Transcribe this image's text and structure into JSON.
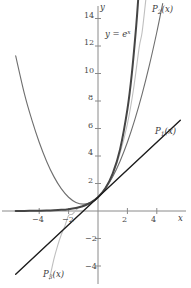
{
  "figure": {
    "background": "#ffffff"
  },
  "axes": {
    "x_label": "x",
    "y_label": "y",
    "x_ticks": [
      {
        "value": -4,
        "label": "−4"
      },
      {
        "value": -2,
        "label": "−2"
      },
      {
        "value": 2,
        "label": "2"
      },
      {
        "value": 4,
        "label": "4"
      }
    ],
    "y_ticks": [
      {
        "value": 14,
        "label": "14"
      },
      {
        "value": 12,
        "label": "12"
      },
      {
        "value": 10,
        "label": "10"
      },
      {
        "value": 8,
        "label": "8"
      },
      {
        "value": 6,
        "label": "6"
      },
      {
        "value": 4,
        "label": "4"
      },
      {
        "value": 2,
        "label": "2"
      },
      {
        "value": -2,
        "label": "−2"
      },
      {
        "value": -4,
        "label": "−4"
      }
    ],
    "axis_color": "#8a8a8a"
  },
  "curve_labels": {
    "exp": {
      "text_prefix": "y = e",
      "text_exponent": "x",
      "full": "y = eˣ"
    },
    "p1": {
      "base": "P",
      "sub": "1",
      "arg": "(x)",
      "full": "P₁(x)"
    },
    "p2": {
      "base": "P",
      "sub": "2",
      "arg": "(x)",
      "full": "P₂(x)"
    },
    "p3": {
      "base": "P",
      "sub": "3",
      "arg": "(x)",
      "full": "P₃(x)"
    }
  },
  "chart_data": {
    "type": "line",
    "title": "",
    "xlabel": "x",
    "ylabel": "y",
    "xlim": [
      -5.6,
      5.6
    ],
    "ylim": [
      -5.2,
      15.4
    ],
    "grid": false,
    "legend": "inline-annotations",
    "series": [
      {
        "name": "y = e^x",
        "label": "y = eˣ",
        "color": "#454545",
        "width": 2.0,
        "formula": "exp(x)",
        "points": [
          [
            -5.6,
            0.0037
          ],
          [
            -5.0,
            0.0067
          ],
          [
            -4.5,
            0.0111
          ],
          [
            -4.0,
            0.0183
          ],
          [
            -3.5,
            0.0302
          ],
          [
            -3.0,
            0.0498
          ],
          [
            -2.5,
            0.0821
          ],
          [
            -2.0,
            0.1353
          ],
          [
            -1.5,
            0.2231
          ],
          [
            -1.0,
            0.3679
          ],
          [
            -0.5,
            0.6065
          ],
          [
            0.0,
            1.0
          ],
          [
            0.5,
            1.6487
          ],
          [
            1.0,
            2.7183
          ],
          [
            1.5,
            4.4817
          ],
          [
            2.0,
            7.3891
          ],
          [
            2.3,
            9.974
          ],
          [
            2.6,
            13.464
          ],
          [
            2.73,
            15.33
          ]
        ]
      },
      {
        "name": "P1(x)",
        "label": "P₁(x)",
        "color": "#1c1c1c",
        "width": 1.4,
        "formula": "1 + x",
        "points": [
          [
            -5.6,
            -4.6
          ],
          [
            5.6,
            6.6
          ]
        ]
      },
      {
        "name": "P2(x)",
        "label": "P₂(x)",
        "color": "#6e6e6e",
        "width": 1.1,
        "formula": "1 + x + x^2/2",
        "points": [
          [
            -5.6,
            11.28
          ],
          [
            -5.0,
            8.5
          ],
          [
            -4.5,
            6.625
          ],
          [
            -4.0,
            5.0
          ],
          [
            -3.5,
            3.625
          ],
          [
            -3.0,
            2.5
          ],
          [
            -2.5,
            1.625
          ],
          [
            -2.0,
            1.0
          ],
          [
            -1.5,
            0.625
          ],
          [
            -1.0,
            0.5
          ],
          [
            -0.5,
            0.625
          ],
          [
            0.0,
            1.0
          ],
          [
            0.5,
            1.625
          ],
          [
            1.0,
            2.5
          ],
          [
            1.5,
            3.625
          ],
          [
            2.0,
            5.0
          ],
          [
            2.5,
            6.625
          ],
          [
            3.0,
            8.5
          ],
          [
            3.5,
            10.625
          ],
          [
            4.0,
            13.0
          ],
          [
            4.4,
            15.08
          ]
        ]
      },
      {
        "name": "P3(x)",
        "label": "P₃(x)",
        "color": "#bfbfbf",
        "width": 1.1,
        "formula": "1 + x + x^2/2 + x^3/6",
        "points": [
          [
            -3.3,
            -4.96
          ],
          [
            -3.0,
            -3.5
          ],
          [
            -2.75,
            -2.53
          ],
          [
            -2.5,
            -1.73
          ],
          [
            -2.25,
            -1.08
          ],
          [
            -2.0,
            -0.333
          ],
          [
            -1.75,
            -0.237
          ],
          [
            -1.5,
            0.0625
          ],
          [
            -1.25,
            0.3255
          ],
          [
            -1.0,
            0.3333
          ],
          [
            -0.5,
            0.6042
          ],
          [
            0.0,
            1.0
          ],
          [
            0.5,
            1.6458
          ],
          [
            1.0,
            2.6667
          ],
          [
            1.5,
            4.1875
          ],
          [
            2.0,
            6.3333
          ],
          [
            2.4,
            8.744
          ],
          [
            2.8,
            11.877
          ],
          [
            3.0,
            13.0
          ],
          [
            3.25,
            15.34
          ]
        ]
      }
    ],
    "annotations": [
      {
        "text": "y = eˣ",
        "x": 0.6,
        "y": 13.2,
        "series": "y = e^x"
      },
      {
        "text": "P₁(x)",
        "x": 5.4,
        "y": 5.6,
        "series": "P1(x)"
      },
      {
        "text": "P₂(x)",
        "x": 4.9,
        "y": 14.9,
        "series": "P2(x)"
      },
      {
        "text": "P₃(x)",
        "x": -3.1,
        "y": -4.8,
        "series": "P3(x)"
      }
    ]
  }
}
